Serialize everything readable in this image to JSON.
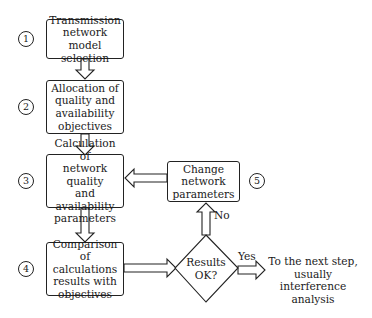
{
  "steps": [
    {
      "number": "1",
      "label": "Transmission network model selection",
      "lines": [
        "Transmission",
        "network model",
        "selection"
      ]
    },
    {
      "number": "2",
      "label": "Allocation of quality and availability objectives",
      "lines": [
        "Allocation of",
        "quality and",
        "availability",
        "objectives"
      ]
    },
    {
      "number": "3",
      "label": "Calculation of network quality and availability parameters",
      "lines": [
        "Calculation of",
        "network quality",
        "and availability",
        "parameters"
      ]
    },
    {
      "number": "4",
      "label": "Comparison of calculations results with objectives",
      "lines": [
        "Comparison of",
        "calculations",
        "results with",
        "objectives"
      ]
    },
    {
      "number": "5",
      "label": "Change network parameters",
      "lines": [
        "Change",
        "network",
        "parameters"
      ]
    }
  ],
  "decision": {
    "lines": [
      "Results",
      "OK?"
    ]
  },
  "edges": {
    "no": "No",
    "yes": "Yes"
  },
  "outcome": {
    "lines": [
      "To the next step,",
      "usually interference",
      "analysis"
    ]
  },
  "colors": {
    "stroke": "#222222",
    "background": "#ffffff"
  }
}
